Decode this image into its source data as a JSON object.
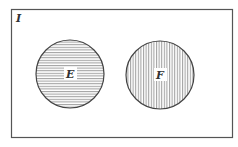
{
  "diagram": {
    "type": "venn",
    "universe_label": "I",
    "sets": [
      {
        "label": "E",
        "hatch": "horizontal"
      },
      {
        "label": "F",
        "hatch": "vertical"
      }
    ],
    "relationship": "disjoint",
    "colors": {
      "stroke": "#444444",
      "hatch": "#555555",
      "background": "#ffffff"
    }
  }
}
